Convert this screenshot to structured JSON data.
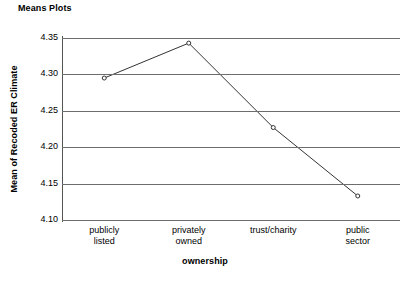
{
  "chart_data": {
    "type": "line",
    "title": "Means Plots",
    "xlabel": "ownership",
    "ylabel": "Mean of Recoded ER Climate",
    "categories": [
      "publicly listed",
      "privately owned",
      "trust/charity",
      "public sector"
    ],
    "category_lines": [
      [
        "publicly",
        "listed"
      ],
      [
        "privately",
        "owned"
      ],
      [
        "trust/charity",
        ""
      ],
      [
        "public",
        "sector"
      ]
    ],
    "values": [
      4.295,
      4.343,
      4.227,
      4.133
    ],
    "ylim": [
      4.1,
      4.35
    ],
    "yticks": [
      "4.10",
      "4.15",
      "4.20",
      "4.25",
      "4.30",
      "4.35"
    ],
    "ytick_values": [
      4.1,
      4.15,
      4.2,
      4.25,
      4.3,
      4.35
    ],
    "grid": true,
    "legend": "none",
    "marker": "open-circle",
    "line_color": "#333333",
    "grid_color": "#6d6d6d",
    "axis_color": "#4a4a4a"
  }
}
